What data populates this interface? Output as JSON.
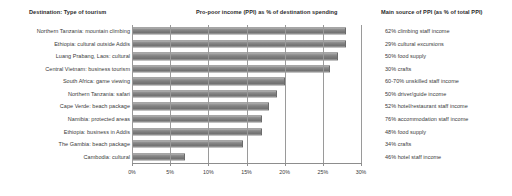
{
  "headers": {
    "left": "Destination: Type of tourism",
    "middle": "Pro-poor income (PPI) as % of destination spending",
    "right": "Main source of PPI (as % of total PPI)"
  },
  "chart_data": {
    "type": "bar",
    "orientation": "horizontal",
    "title": "Pro-poor income (PPI) as % of destination spending",
    "xlabel": "",
    "ylabel": "",
    "xlim": [
      0,
      30
    ],
    "grid": true,
    "legend": null,
    "bar_color": "#7c7c7c",
    "xticks": [
      0,
      5,
      10,
      15,
      20,
      25,
      30
    ],
    "xticklabels": [
      "0%",
      "5%",
      "10%",
      "15%",
      "20%",
      "25%",
      "30%"
    ],
    "categories": [
      "Northern Tanzania: mountain climbing",
      "Ethiopia: cultural outside Addis",
      "Luang Prabang, Laos: cultural",
      "Central Vietnam: business tourism",
      "South Africa: game viewing",
      "Northern Tanzania: safari",
      "Cape Verde: beach package",
      "Namibia: protected areas",
      "Ethiopia: business in Addis",
      "The Gambia: beach package",
      "Cambodia: cultural"
    ],
    "values": [
      28,
      28,
      27,
      26,
      20,
      19,
      18,
      17,
      17,
      14.5,
      7
    ],
    "annotations": [
      "62% climbing staff income",
      "29% cultural excursions",
      "50% food supply",
      "30% crafts",
      "60-70% unskilled staff income",
      "50% driver/guide income",
      "52% hotel/restaurant staff income",
      "76% accommodation staff income",
      "48% food supply",
      "34% crafts",
      "46% hotel staff income"
    ]
  }
}
